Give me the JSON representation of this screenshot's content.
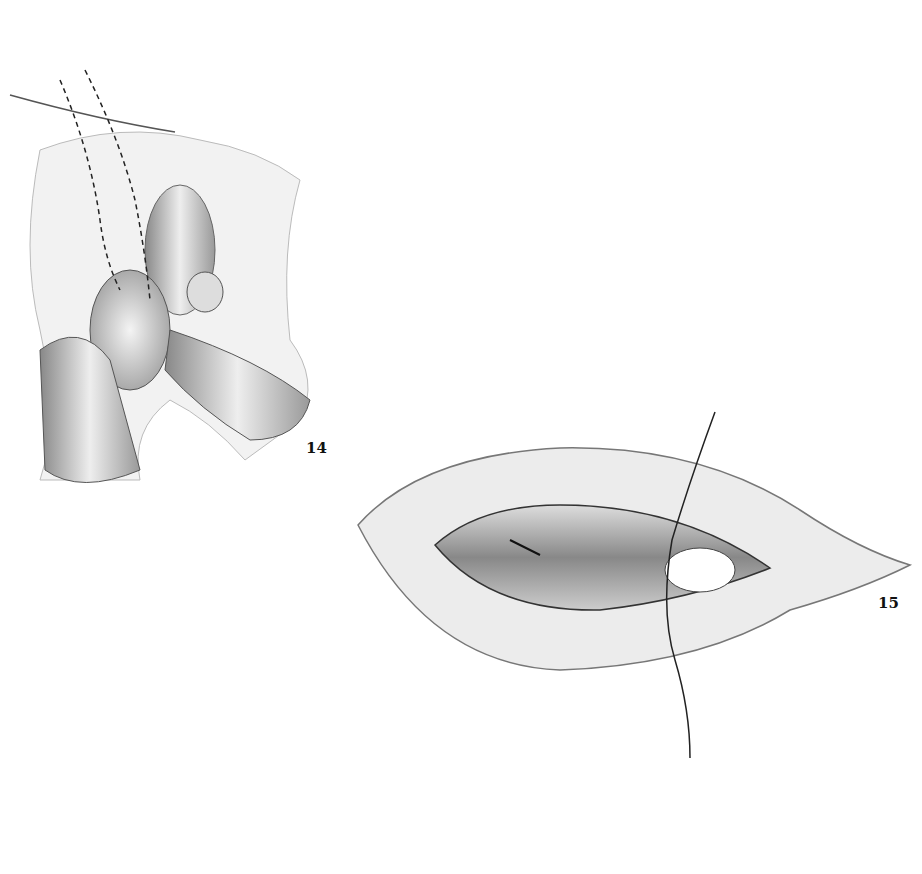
{
  "figures": [
    {
      "number": "14",
      "description": "Surgical illustration: retraction with finger, dashed incision lines"
    },
    {
      "number": "15",
      "description": "Surgical illustration: elliptical incision showing exposed tissue with suture"
    }
  ]
}
